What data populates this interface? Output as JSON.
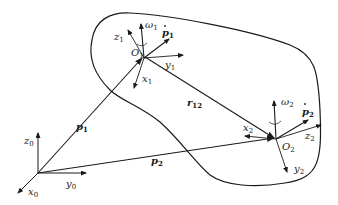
{
  "diagram": {
    "type": "rigid-body kinematics",
    "frames": [
      {
        "origin": "",
        "axes": {
          "x": "x",
          "y": "y",
          "z": "z"
        },
        "sub": "0"
      },
      {
        "origin": "O",
        "sub": "1",
        "axes": {
          "x": "x",
          "y": "y",
          "z": "z"
        },
        "angular_velocity": "ω",
        "linear_velocity": "p"
      },
      {
        "origin": "O",
        "sub": "2",
        "axes": {
          "x": "x",
          "y": "y",
          "z": "z"
        },
        "angular_velocity": "ω",
        "linear_velocity": "p"
      }
    ],
    "vectors": {
      "p1": {
        "name": "p",
        "sub": "1"
      },
      "p2": {
        "name": "p",
        "sub": "2"
      },
      "r12": {
        "name": "r",
        "sub": "12"
      }
    },
    "labels": {
      "x0": "x",
      "y0": "y",
      "z0": "z",
      "s0": "0",
      "x1": "x",
      "y1": "y",
      "z1": "z",
      "s1": "1",
      "x2": "x",
      "y2": "y",
      "z2": "z",
      "s2": "2",
      "O": "O",
      "omega": "ω",
      "p": "p",
      "r": "r",
      "s12": "12"
    },
    "colors": {
      "stroke": "#1a1a1a",
      "background": "#ffffff"
    }
  }
}
